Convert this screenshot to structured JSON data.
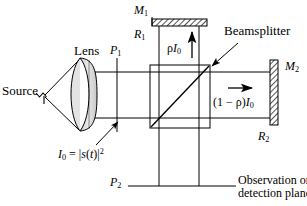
{
  "figure": {
    "type": "optical-schematic",
    "background_color": "#ffffff",
    "line_color": "#000000",
    "hatch_color": "#808080",
    "glass_fill": "#d9d9d9",
    "width": 307,
    "height": 206
  },
  "labels": {
    "source": "Source",
    "lens": "Lens",
    "beamsplitter": "Beamsplitter",
    "mirror_1": {
      "letter": "M",
      "sub": "1"
    },
    "mirror_2": {
      "letter": "M",
      "sub": "2"
    },
    "plane_1": {
      "letter": "P",
      "sub": "1"
    },
    "plane_2": {
      "letter": "P",
      "sub": "2"
    },
    "reflectance_1": {
      "letter": "R",
      "sub": "1"
    },
    "reflectance_2": {
      "letter": "R",
      "sub": "2"
    },
    "reflected_beam": {
      "rho": "ρ",
      "I": "I",
      "sub": "0"
    },
    "transmitted_beam": {
      "prefix": "(1 − ρ)",
      "I": "I",
      "sub": "0"
    },
    "intensity_expression": {
      "I": "I",
      "sub": "0",
      "equals": "=",
      "modulus_open": "|",
      "s": "s",
      "paren_open": "(",
      "t": "t",
      "paren_close": ")",
      "modulus_close": "|",
      "power": "2"
    },
    "detection_plane_line_1": "Observation or",
    "detection_plane_line_2": "detection plane"
  },
  "geometry": {
    "beam_top_y": 72,
    "beam_bottom_y": 118,
    "splitter_box": {
      "x": 150,
      "y": 65,
      "w": 60,
      "h": 63
    },
    "mirror_1_bar": {
      "x": 152,
      "y": 19,
      "w": 55,
      "h": 7
    },
    "mirror_2_bar": {
      "x": 270,
      "y": 60,
      "w": 8,
      "h": 65
    },
    "plane_1_x": 117,
    "plane_2_y": 186,
    "lens_center_x": 87,
    "source_point": {
      "x": 42,
      "y": 96
    }
  }
}
